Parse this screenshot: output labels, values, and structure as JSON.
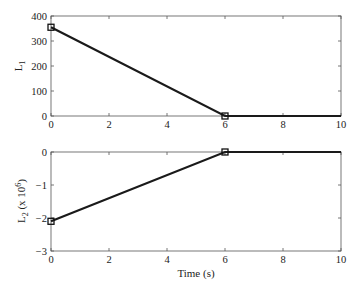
{
  "chart_data": [
    {
      "type": "line",
      "title": "",
      "xlabel": "",
      "ylabel": "L",
      "ylabel_subscript": "1",
      "ylabel_suffix": "",
      "xlim": [
        0,
        10
      ],
      "ylim": [
        0,
        400
      ],
      "xticks": [
        0,
        2,
        4,
        6,
        8,
        10
      ],
      "yticks": [
        0,
        100,
        200,
        300,
        400
      ],
      "grid": false,
      "legend": null,
      "series": [
        {
          "name": "L1",
          "x": [
            0,
            6,
            10
          ],
          "y": [
            355,
            0,
            0
          ],
          "color": "#1a1a1a",
          "markers": [
            {
              "x": 0,
              "y": 355
            },
            {
              "x": 6,
              "y": 0
            }
          ],
          "marker_shape": "square"
        }
      ]
    },
    {
      "type": "line",
      "title": "",
      "xlabel": "Time (s)",
      "ylabel": "L",
      "ylabel_subscript": "2",
      "ylabel_suffix": " (x 10",
      "ylabel_exponent": "6",
      "ylabel_close": ")",
      "xlim": [
        0,
        10
      ],
      "ylim": [
        -3,
        0
      ],
      "xticks": [
        0,
        2,
        4,
        6,
        8,
        10
      ],
      "yticks": [
        -3,
        -2,
        -1,
        0
      ],
      "grid": false,
      "legend": null,
      "series": [
        {
          "name": "L2",
          "x": [
            0,
            6,
            10
          ],
          "y": [
            -2.1,
            0,
            0
          ],
          "color": "#1a1a1a",
          "markers": [
            {
              "x": 0,
              "y": -2.1
            },
            {
              "x": 6,
              "y": 0
            }
          ],
          "marker_shape": "square"
        }
      ]
    }
  ],
  "labels": {
    "top_ylabel_main": "L",
    "top_ylabel_sub": "1",
    "bottom_ylabel_main": "L",
    "bottom_ylabel_sub": "2",
    "bottom_ylabel_mid": " (x 10",
    "bottom_ylabel_exp": "6",
    "bottom_ylabel_end": ")",
    "xlabel": "Time (s)"
  }
}
